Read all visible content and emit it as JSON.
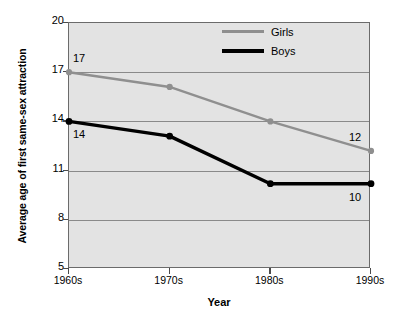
{
  "chart_data": {
    "type": "line",
    "title": "",
    "xlabel": "Year",
    "ylabel": "Average age of first same-sex attraction",
    "categories": [
      "1960s",
      "1970s",
      "1980s",
      "1990s"
    ],
    "ylim": [
      5,
      20
    ],
    "yticks": [
      5,
      8,
      11,
      14,
      17,
      20
    ],
    "gridlines": [
      8,
      11,
      14,
      17
    ],
    "grid": true,
    "legend_position": "top-right",
    "series": [
      {
        "name": "Girls",
        "color": "#8f8f8f",
        "values": [
          17.0,
          16.1,
          14.0,
          12.2
        ],
        "point_labels": [
          "17",
          "",
          "",
          "12"
        ]
      },
      {
        "name": "Boys",
        "color": "#000000",
        "values": [
          14.0,
          13.1,
          10.2,
          10.2
        ],
        "point_labels": [
          "14",
          "",
          "",
          "10"
        ]
      }
    ],
    "annotations": [
      {
        "text": "17",
        "series": "Girls",
        "category": "1960s",
        "placement": "above-right"
      },
      {
        "text": "12",
        "series": "Girls",
        "category": "1990s",
        "placement": "above-left"
      },
      {
        "text": "14",
        "series": "Boys",
        "category": "1960s",
        "placement": "below-right"
      },
      {
        "text": "10",
        "series": "Boys",
        "category": "1990s",
        "placement": "below-left"
      }
    ],
    "plot_background": "#e3e3e3",
    "grid_color": "#8a8a8a",
    "axis_color": "#6b6b6b"
  }
}
